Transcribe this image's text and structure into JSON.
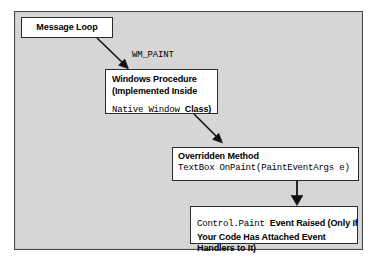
{
  "diagram": {
    "background_color": "#d6d6d6",
    "node_fill_color": "#ffffff",
    "border_color": "#2b2b2b",
    "nodes": [
      {
        "id": "message-loop",
        "lines": [
          {
            "text": "Message Loop",
            "style": "sans-bold"
          }
        ]
      },
      {
        "id": "windows-procedure",
        "lines": [
          {
            "text": "Windows Procedure",
            "style": "sans-bold"
          },
          {
            "text": "(Implemented Inside",
            "style": "sans-bold"
          },
          {
            "text": "Native Window ",
            "style": "mono",
            "tail": "Class)",
            "tail_style": "sans-bold"
          }
        ]
      },
      {
        "id": "overridden-method",
        "lines": [
          {
            "text": "Overridden Method",
            "style": "sans-bold"
          },
          {
            "text": "TextBox OnPaint(PaintEventArgs e)",
            "style": "mono"
          }
        ]
      },
      {
        "id": "control-paint",
        "lines": [
          {
            "text": "Control.Paint ",
            "style": "mono",
            "tail": "Event Raised (Only If",
            "tail_style": "sans-bold"
          },
          {
            "text": "Your Code Has Attached Event",
            "style": "sans-bold"
          },
          {
            "text": "Handlers to It)",
            "style": "sans-bold"
          }
        ]
      }
    ],
    "edges": [
      {
        "id": "edge-message-loop-to-windows-procedure",
        "label": "WM_PAINT",
        "label_style": "mono"
      },
      {
        "id": "edge-windows-procedure-to-overridden-method",
        "label": ""
      },
      {
        "id": "edge-overridden-method-to-control-paint",
        "label": ""
      }
    ],
    "node_text": {
      "message_loop_l1": "Message Loop",
      "windows_procedure_l1": "Windows Procedure",
      "windows_procedure_l2": "(Implemented Inside",
      "windows_procedure_l3_mono": "Native Window ",
      "windows_procedure_l3_bold": "Class)",
      "overridden_method_l1": "Overridden Method",
      "overridden_method_l2": "TextBox OnPaint(PaintEventArgs e)",
      "control_paint_l1_mono": "Control.Paint ",
      "control_paint_l1_bold": "Event Raised (Only If",
      "control_paint_l2": "Your Code Has Attached Event",
      "control_paint_l3": "Handlers to It)"
    },
    "edge_labels": {
      "wm_paint": "WM_PAINT"
    }
  }
}
